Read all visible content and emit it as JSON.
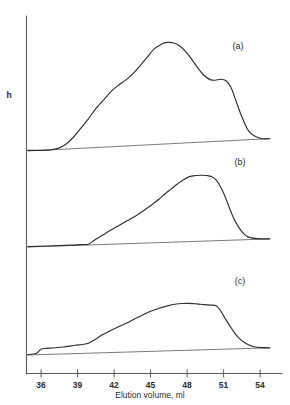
{
  "figure": {
    "title": "",
    "y_axis_label": "h",
    "x_axis_label": "Elution volume, ml",
    "panel_labels": [
      "(a)",
      "(b)",
      "(c)"
    ],
    "tick_labels": [
      "36",
      "39",
      "42",
      "45",
      "48",
      "51",
      "54"
    ],
    "line_color": "#2f2f2f",
    "axis_color": "#5a5a5a",
    "baseline_color": "#6b6b6b",
    "background_color": "#ffffff"
  },
  "chart_data": {
    "type": "line",
    "title": "",
    "subtitle": "",
    "xlabel": "Elution volume, ml",
    "ylabel": "h",
    "xlim": [
      34.8,
      55.8
    ],
    "xticks": [
      36,
      39,
      42,
      45,
      48,
      51,
      54
    ],
    "grid": false,
    "legend": "none",
    "annotations": [
      "(a)",
      "(b)",
      "(c)"
    ],
    "panels": [
      {
        "name": "(a)",
        "label": "(a)",
        "ylim": [
          0,
          1
        ],
        "ylabel": "h",
        "baseline": {
          "x": [
            34.9,
            54.8
          ],
          "y": [
            0.0,
            0.105
          ]
        },
        "x": [
          34.9,
          36.6,
          37.4,
          38.0,
          38.6,
          39.2,
          39.9,
          40.5,
          41.2,
          41.8,
          42.4,
          43.0,
          43.6,
          44.2,
          44.8,
          45.3,
          45.9,
          46.4,
          46.9,
          47.4,
          47.9,
          48.4,
          48.9,
          49.4,
          49.9,
          50.3,
          50.8,
          51.2,
          51.6,
          52.0,
          52.5,
          53.1,
          54.0,
          54.8
        ],
        "y": [
          0.005,
          0.008,
          0.022,
          0.055,
          0.11,
          0.185,
          0.275,
          0.36,
          0.44,
          0.51,
          0.56,
          0.605,
          0.66,
          0.73,
          0.805,
          0.865,
          0.905,
          0.92,
          0.915,
          0.89,
          0.84,
          0.775,
          0.7,
          0.64,
          0.605,
          0.6,
          0.608,
          0.595,
          0.54,
          0.43,
          0.29,
          0.165,
          0.108,
          0.105
        ]
      },
      {
        "name": "(b)",
        "label": "(b)",
        "ylim": [
          0,
          1
        ],
        "ylabel": "h",
        "baseline": {
          "x": [
            34.9,
            54.8
          ],
          "y": [
            0.0,
            0.092
          ]
        },
        "x": [
          34.9,
          38.0,
          39.5,
          39.9,
          40.4,
          41.0,
          41.7,
          42.4,
          43.1,
          43.8,
          44.5,
          45.1,
          45.7,
          46.2,
          46.7,
          47.2,
          47.7,
          48.2,
          48.7,
          49.2,
          49.6,
          50.0,
          50.4,
          50.8,
          51.2,
          51.6,
          52.0,
          52.5,
          53.0,
          53.8,
          54.8
        ],
        "y": [
          0.005,
          0.018,
          0.028,
          0.032,
          0.08,
          0.13,
          0.19,
          0.245,
          0.3,
          0.355,
          0.42,
          0.48,
          0.545,
          0.605,
          0.66,
          0.715,
          0.765,
          0.8,
          0.812,
          0.815,
          0.812,
          0.8,
          0.76,
          0.67,
          0.545,
          0.4,
          0.28,
          0.175,
          0.115,
          0.095,
          0.092
        ]
      },
      {
        "name": "(c)",
        "label": "(c)",
        "ylim": [
          0,
          1
        ],
        "ylabel": "h",
        "baseline": {
          "x": [
            34.9,
            54.8
          ],
          "y": [
            0.0,
            0.092
          ]
        },
        "x": [
          34.9,
          35.6,
          36.0,
          36.4,
          37.0,
          37.6,
          38.2,
          38.8,
          39.4,
          39.9,
          40.4,
          41.0,
          41.6,
          42.2,
          42.9,
          43.6,
          44.3,
          45.0,
          45.7,
          46.4,
          47.0,
          47.6,
          48.2,
          48.8,
          49.4,
          49.9,
          50.4,
          50.8,
          51.2,
          51.7,
          52.2,
          52.8,
          53.5,
          54.3,
          54.8
        ],
        "y": [
          0.005,
          0.02,
          0.075,
          0.085,
          0.09,
          0.1,
          0.11,
          0.125,
          0.135,
          0.15,
          0.195,
          0.255,
          0.305,
          0.35,
          0.4,
          0.455,
          0.51,
          0.56,
          0.6,
          0.63,
          0.65,
          0.66,
          0.662,
          0.655,
          0.645,
          0.64,
          0.63,
          0.555,
          0.45,
          0.33,
          0.225,
          0.15,
          0.105,
          0.094,
          0.092
        ]
      }
    ]
  }
}
